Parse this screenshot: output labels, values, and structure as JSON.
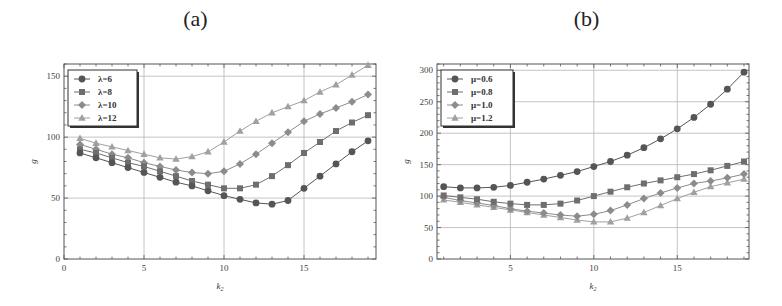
{
  "chart_data": [
    {
      "type": "line",
      "title": "(a)",
      "xlabel": "k2",
      "ylabel": "g",
      "xlim": [
        0,
        19.5
      ],
      "ylim": [
        0,
        160
      ],
      "xticks": [
        0,
        5,
        10,
        15
      ],
      "yticks": [
        0,
        50,
        100,
        150
      ],
      "grid": true,
      "legend_position": "top-left",
      "x": [
        1,
        2,
        3,
        4,
        5,
        6,
        7,
        8,
        9,
        10,
        11,
        12,
        13,
        14,
        15,
        16,
        17,
        18,
        19
      ],
      "series": [
        {
          "name": "λ=6",
          "marker": "circle",
          "color": "#555555",
          "values": [
            87,
            83,
            79,
            75,
            71,
            67,
            63,
            60,
            56,
            52,
            49,
            46,
            45,
            48,
            58,
            68,
            78,
            88,
            97
          ]
        },
        {
          "name": "λ=8",
          "marker": "square",
          "color": "#6e6e6e",
          "values": [
            90,
            87,
            83,
            79,
            76,
            72,
            68,
            64,
            61,
            58,
            58,
            61,
            68,
            77,
            87,
            96,
            105,
            112,
            118
          ]
        },
        {
          "name": "λ=10",
          "marker": "diamond",
          "color": "#8c8c8c",
          "values": [
            94,
            90,
            86,
            83,
            79,
            76,
            73,
            71,
            70,
            72,
            78,
            86,
            95,
            104,
            113,
            119,
            124,
            129,
            135
          ]
        },
        {
          "name": "λ=12",
          "marker": "triangle",
          "color": "#a0a0a0",
          "values": [
            99,
            95,
            92,
            89,
            86,
            83,
            82,
            84,
            88,
            96,
            105,
            113,
            120,
            125,
            130,
            137,
            143,
            151,
            159
          ]
        }
      ]
    },
    {
      "type": "line",
      "title": "(b)",
      "xlabel": "k2",
      "ylabel": "g",
      "xlim": [
        0.6,
        19.3
      ],
      "ylim": [
        0,
        310
      ],
      "xticks": [
        5,
        10,
        15
      ],
      "yticks": [
        0,
        50,
        100,
        150,
        200,
        250,
        300
      ],
      "grid": true,
      "legend_position": "top-left",
      "x": [
        1,
        2,
        3,
        4,
        5,
        6,
        7,
        8,
        9,
        10,
        11,
        12,
        13,
        14,
        15,
        16,
        17,
        18,
        19
      ],
      "series": [
        {
          "name": "μ=0.6",
          "marker": "circle",
          "color": "#555555",
          "values": [
            115,
            113,
            113,
            114,
            117,
            122,
            127,
            133,
            139,
            147,
            155,
            165,
            177,
            191,
            207,
            225,
            246,
            270,
            297
          ]
        },
        {
          "name": "μ=0.8",
          "marker": "square",
          "color": "#6e6e6e",
          "values": [
            101,
            98,
            95,
            91,
            88,
            86,
            86,
            88,
            93,
            100,
            107,
            114,
            120,
            125,
            130,
            135,
            141,
            148,
            155
          ]
        },
        {
          "name": "μ=1.0",
          "marker": "diamond",
          "color": "#8c8c8c",
          "values": [
            98,
            93,
            89,
            85,
            80,
            76,
            73,
            70,
            68,
            71,
            77,
            86,
            96,
            105,
            113,
            120,
            124,
            129,
            135
          ]
        },
        {
          "name": "μ=1.2",
          "marker": "triangle",
          "color": "#a0a0a0",
          "values": [
            94,
            90,
            86,
            82,
            78,
            74,
            70,
            66,
            62,
            59,
            59,
            65,
            74,
            85,
            96,
            106,
            115,
            121,
            127
          ]
        }
      ]
    }
  ],
  "panels": [
    {
      "title": "(a)",
      "xlabel": "k",
      "xlabel_sub": "2",
      "ylabel": "g"
    },
    {
      "title": "(b)",
      "xlabel": "k",
      "xlabel_sub": "2",
      "ylabel": "g"
    }
  ]
}
